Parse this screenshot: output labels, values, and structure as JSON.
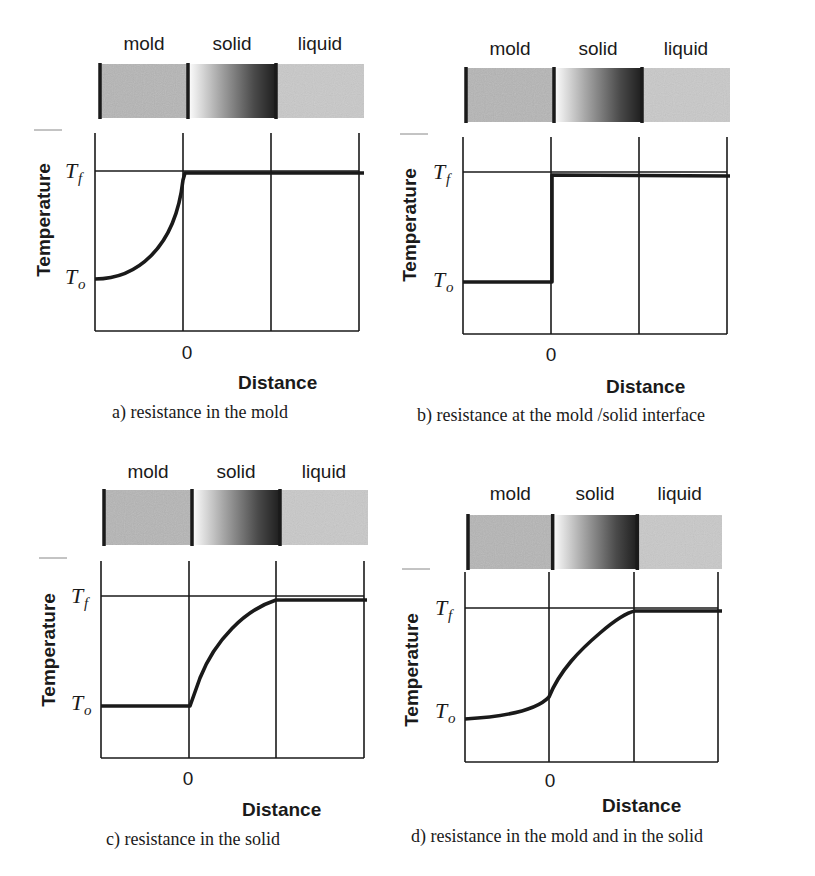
{
  "figure": {
    "region_labels": [
      "mold",
      "solid",
      "liquid"
    ],
    "ylabel": "Temperature",
    "xlabel": "Distance",
    "zero_tick": "0",
    "tf_symbol": "T",
    "tf_sub": "f",
    "to_symbol": "T",
    "to_sub": "o"
  },
  "colors": {
    "mold_fill": "#b5b5b5",
    "liquid_fill": "#c9c9c9",
    "solid_dark": "#1e1e1e",
    "line": "#1a1a1a"
  },
  "panels": [
    {
      "id": "a",
      "caption": "a) resistance in the mold",
      "bar": {
        "x": 100,
        "y": 64,
        "w": 264,
        "h": 54
      },
      "labels_y": 50,
      "plot": {
        "x": 95,
        "y": 133,
        "w": 264,
        "h": 198
      },
      "tf_y": 171,
      "to_y": 279,
      "zero_x": 183,
      "third_x": 271,
      "ylabel_x": 50,
      "ylabel_cy": 220,
      "xlabel": {
        "x": 238,
        "y": 389
      },
      "zero_label": {
        "x": 187,
        "y": 359
      },
      "caption_pos": {
        "x": 112,
        "y": 418
      },
      "curve": "M95,279 C135,279 175,250 183,180 L185,173 L364,173"
    },
    {
      "id": "b",
      "caption": "b) resistance at the mold /solid interface",
      "bar": {
        "x": 466,
        "y": 68,
        "w": 264,
        "h": 54
      },
      "labels_y": 55,
      "plot": {
        "x": 463,
        "y": 137,
        "w": 264,
        "h": 197
      },
      "tf_y": 172,
      "to_y": 282,
      "zero_x": 551,
      "third_x": 639,
      "ylabel_x": 416,
      "ylabel_cy": 225,
      "xlabel": {
        "x": 606,
        "y": 393
      },
      "zero_label": {
        "x": 551,
        "y": 361
      },
      "caption_pos": {
        "x": 417,
        "y": 421
      },
      "curve": "M463,282 L552,282 L552,175 L730,176"
    },
    {
      "id": "c",
      "caption": "c) resistance in the solid",
      "bar": {
        "x": 104,
        "y": 490,
        "w": 264,
        "h": 55
      },
      "labels_y": 478,
      "plot": {
        "x": 101,
        "y": 561,
        "w": 263,
        "h": 197
      },
      "tf_y": 596,
      "to_y": 705,
      "zero_x": 189,
      "third_x": 276,
      "ylabel_x": 55,
      "ylabel_cy": 650,
      "xlabel": {
        "x": 242,
        "y": 816
      },
      "zero_label": {
        "x": 188,
        "y": 785
      },
      "caption_pos": {
        "x": 106,
        "y": 845
      },
      "curve": "M101,706 L190,706 L200,678 C215,640 245,610 276,600 L367,600"
    },
    {
      "id": "d",
      "caption": "d) resistance in the mold and in the solid",
      "bar": {
        "x": 468,
        "y": 515,
        "w": 254,
        "h": 54
      },
      "labels_y": 500,
      "plot": {
        "x": 465,
        "y": 572,
        "w": 253,
        "h": 190
      },
      "tf_y": 608,
      "to_y": 713,
      "zero_x": 549,
      "third_x": 634,
      "ylabel_x": 418,
      "ylabel_cy": 670,
      "xlabel": {
        "x": 602,
        "y": 812
      },
      "zero_label": {
        "x": 550,
        "y": 787
      },
      "caption_pos": {
        "x": 411,
        "y": 842
      },
      "curve": "M465,719 C500,717 535,712 549,697 C560,670 580,650 600,633 C615,620 625,613 635,611 L722,611"
    }
  ],
  "chart_data": [
    {
      "type": "line",
      "title": "a) resistance in the mold",
      "xlabel": "Distance",
      "ylabel": "Temperature",
      "x_ticks": [
        "0"
      ],
      "y_ticks": [
        "To",
        "Tf"
      ],
      "regions": [
        "mold",
        "solid",
        "liquid"
      ],
      "x": [
        -1,
        -0.5,
        -0.1,
        0,
        0.01,
        1,
        2
      ],
      "values": [
        0,
        0.15,
        0.6,
        0.95,
        1,
        1,
        1
      ],
      "description": "Temperature rises curving from To in mold to Tf at interface x=0; flat at Tf through solid and liquid"
    },
    {
      "type": "line",
      "title": "b) resistance at the mold /solid interface",
      "xlabel": "Distance",
      "ylabel": "Temperature",
      "x_ticks": [
        "0"
      ],
      "y_ticks": [
        "To",
        "Tf"
      ],
      "regions": [
        "mold",
        "solid",
        "liquid"
      ],
      "x": [
        -1,
        0,
        0,
        1,
        2
      ],
      "values": [
        0,
        0,
        1,
        1,
        1
      ],
      "description": "Flat at To in mold, step jump at interface to Tf, flat in solid and liquid"
    },
    {
      "type": "line",
      "title": "c) resistance in the solid",
      "xlabel": "Distance",
      "ylabel": "Temperature",
      "x_ticks": [
        "0"
      ],
      "y_ticks": [
        "To",
        "Tf"
      ],
      "regions": [
        "mold",
        "solid",
        "liquid"
      ],
      "x": [
        -1,
        0,
        0.25,
        0.5,
        0.75,
        1,
        2
      ],
      "values": [
        0,
        0,
        0.45,
        0.72,
        0.9,
        1,
        1
      ],
      "description": "Flat at To in mold, concave rise across solid reaching Tf at solid/liquid boundary, flat in liquid"
    },
    {
      "type": "line",
      "title": "d) resistance in the mold and in the solid",
      "xlabel": "Distance",
      "ylabel": "Temperature",
      "x_ticks": [
        "0"
      ],
      "y_ticks": [
        "To",
        "Tf"
      ],
      "regions": [
        "mold",
        "solid",
        "liquid"
      ],
      "x": [
        -1,
        -0.5,
        0,
        0.3,
        0.6,
        1,
        2
      ],
      "values": [
        -0.05,
        0.0,
        0.15,
        0.5,
        0.78,
        1,
        1
      ],
      "description": "Gradual rise in mold, steeper rise across solid reaching Tf at solid/liquid boundary, flat in liquid"
    }
  ]
}
